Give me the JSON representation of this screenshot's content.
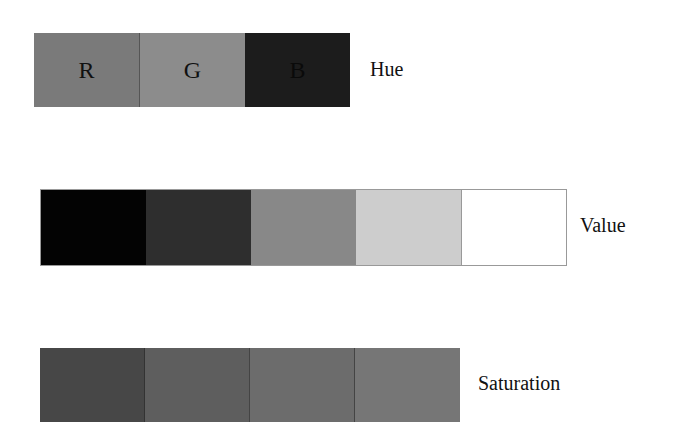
{
  "hue": {
    "label": "Hue",
    "swatches": [
      {
        "letter": "R",
        "color": "#7a7a7a"
      },
      {
        "letter": "G",
        "color": "#8c8c8c"
      },
      {
        "letter": "B",
        "color": "#1c1c1c"
      }
    ]
  },
  "value": {
    "label": "Value",
    "swatches": [
      {
        "color": "#030303"
      },
      {
        "color": "#2e2e2e"
      },
      {
        "color": "#888888"
      },
      {
        "color": "#cdcdcd"
      },
      {
        "color": "#ffffff"
      }
    ]
  },
  "saturation": {
    "label": "Saturation",
    "swatches": [
      {
        "color": "#474747"
      },
      {
        "color": "#5e5e5e"
      },
      {
        "color": "#6c6c6c"
      },
      {
        "color": "#767676"
      }
    ]
  }
}
